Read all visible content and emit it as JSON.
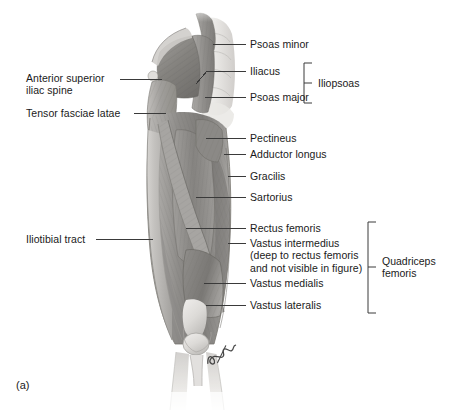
{
  "figure": {
    "caption": "(a)",
    "view": "Anterior view of hip and thigh muscles",
    "signature": "artist-signature"
  },
  "colors": {
    "background": "#ffffff",
    "text": "#1a1a1a",
    "leader_line": "#3a3a3a",
    "bracket": "#3a3a3a",
    "muscle_dark": "#6f6f6f",
    "muscle_mid": "#9a9a9a",
    "muscle_light": "#c6c6c6",
    "bone_light": "#e4e2df"
  },
  "labels_right": [
    {
      "id": "psoas-minor",
      "text": "Psoas minor"
    },
    {
      "id": "iliacus",
      "text": "Iliacus"
    },
    {
      "id": "psoas-major",
      "text": "Psoas major"
    },
    {
      "id": "pectineus",
      "text": "Pectineus"
    },
    {
      "id": "adductor-longus",
      "text": "Adductor longus"
    },
    {
      "id": "gracilis",
      "text": "Gracilis"
    },
    {
      "id": "sartorius",
      "text": "Sartorius"
    },
    {
      "id": "rectus-femoris",
      "text": "Rectus femoris"
    },
    {
      "id": "vastus-intermedius",
      "text": "Vastus intermedius\n(deep to rectus femoris\nand not visible in figure)"
    },
    {
      "id": "vastus-medialis",
      "text": "Vastus medialis"
    },
    {
      "id": "vastus-lateralis",
      "text": "Vastus lateralis"
    }
  ],
  "labels_left": [
    {
      "id": "anterior-superior-iliac-spine",
      "text": "Anterior superior\niliac spine"
    },
    {
      "id": "tensor-fasciae-latae",
      "text": "Tensor fasciae latae"
    },
    {
      "id": "iliotibial-tract",
      "text": "Iliotibial tract"
    }
  ],
  "groups": [
    {
      "id": "iliopsoas",
      "text": "Iliopsoas",
      "members": [
        "Iliacus",
        "Psoas major"
      ]
    },
    {
      "id": "quadriceps-femoris",
      "text": "Quadriceps\nfemoris",
      "members": [
        "Rectus femoris",
        "Vastus intermedius",
        "Vastus medialis",
        "Vastus lateralis"
      ]
    }
  ]
}
